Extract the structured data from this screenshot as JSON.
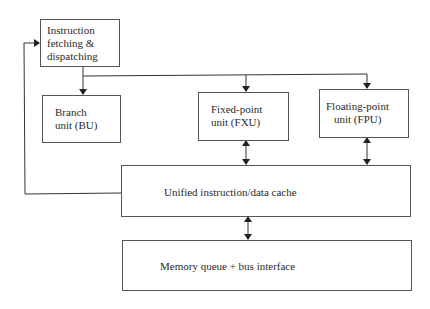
{
  "diagram": {
    "type": "block-diagram",
    "blocks": {
      "ifd": {
        "lines": [
          "Instruction",
          "fetching &",
          "dispatching"
        ]
      },
      "bu": {
        "lines": [
          "Branch",
          "unit (BU)"
        ]
      },
      "fxu": {
        "lines": [
          "Fixed-point",
          "unit (FXU)"
        ]
      },
      "fpu": {
        "lines": [
          "Floating-point",
          "unit (FPU)"
        ]
      },
      "cache": {
        "label": "Unified instruction/data cache"
      },
      "memory": {
        "label": "Memory queue + bus interface"
      }
    },
    "connections": [
      {
        "from": "Instruction fetching & dispatching",
        "to": "Branch unit (BU)",
        "direction": "one-way"
      },
      {
        "from": "Instruction fetching & dispatching",
        "to": "Fixed-point unit (FXU)",
        "direction": "one-way"
      },
      {
        "from": "Instruction fetching & dispatching",
        "to": "Floating-point unit (FPU)",
        "direction": "one-way"
      },
      {
        "from": "Fixed-point unit (FXU)",
        "to": "Unified instruction/data cache",
        "direction": "bidirectional"
      },
      {
        "from": "Floating-point unit (FPU)",
        "to": "Unified instruction/data cache",
        "direction": "bidirectional"
      },
      {
        "from": "Unified instruction/data cache",
        "to": "Memory queue + bus interface",
        "direction": "bidirectional"
      },
      {
        "from": "Unified instruction/data cache",
        "to": "Instruction fetching & dispatching",
        "direction": "one-way"
      }
    ],
    "colors": {
      "line": "#333333",
      "box_border": "#555555",
      "text": "#2a2a2a",
      "background": "#ffffff"
    }
  }
}
